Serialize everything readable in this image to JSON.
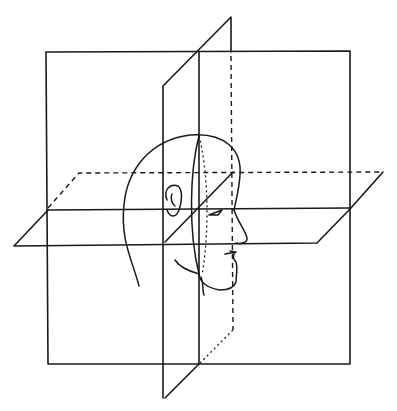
{
  "figure": {
    "planes": [
      {
        "name": "frontal-plane",
        "shape": "square"
      },
      {
        "name": "sagittal-plane",
        "shape": "parallelogram"
      },
      {
        "name": "transverse-plane",
        "shape": "parallelogram"
      }
    ],
    "head_facing": "right",
    "line_color": "#1a1a1a",
    "background": "#ffffff"
  }
}
